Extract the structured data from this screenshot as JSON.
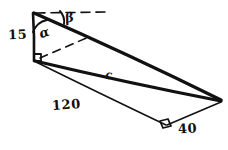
{
  "figure": {
    "ink_color": "#111111",
    "background_color": "#ffffff",
    "labels": {
      "vertical_side": "15",
      "angle_alpha": "α",
      "angle_beta": "β",
      "hypotenuse": "c",
      "base": "120",
      "short_side": "40"
    }
  }
}
